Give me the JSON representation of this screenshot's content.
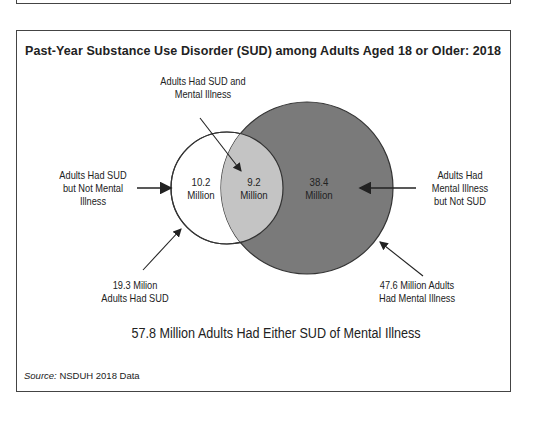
{
  "title": "Past-Year Substance Use Disorder (SUD) among Adults Aged 18 or Older: 2018",
  "labels": {
    "overlap_top_line1": "Adults Had SUD and",
    "overlap_top_line2": "Mental Illness",
    "sud_only_line1": "Adults Had SUD",
    "sud_only_line2": "but Not Mental",
    "sud_only_line3": "Illness",
    "mi_only_line1": "Adults Had",
    "mi_only_line2": "Mental Illness",
    "mi_only_line3": "but Not SUD",
    "sud_total_line1": "19.3 Milion",
    "sud_total_line2": "Adults Had SUD",
    "mi_total_line1": "47.6 Million Adults",
    "mi_total_line2": "Had Mental Illness"
  },
  "regions": {
    "sud_only_value": "10.2",
    "sud_only_unit": "Million",
    "overlap_value": "9.2",
    "overlap_unit": "Million",
    "mi_only_value": "38.4",
    "mi_only_unit": "Million"
  },
  "caption": "57.8 Million Adults Had Either SUD of Mental Illness",
  "source_label": "Source:",
  "source_text": " NSDUH 2018 Data",
  "colors": {
    "mental_illness_fill": "#7a7a7a",
    "overlap_fill": "#c4c4c4",
    "sud_fill": "#ffffff",
    "stroke": "#333333"
  }
}
